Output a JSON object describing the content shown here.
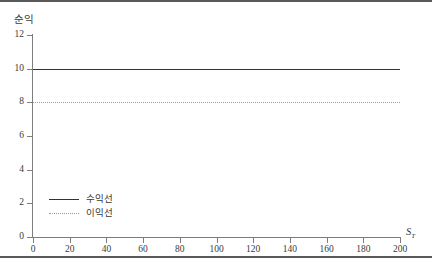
{
  "chart_data": {
    "type": "line",
    "title": "",
    "xlabel": "S_T",
    "xlabel_base": "S",
    "xlabel_sub": "T",
    "ylabel": "순익",
    "xlim": [
      0,
      200
    ],
    "ylim": [
      0,
      12
    ],
    "xticks": [
      0,
      20,
      40,
      60,
      80,
      100,
      120,
      140,
      160,
      180,
      200
    ],
    "yticks": [
      0,
      2,
      4,
      6,
      8,
      10,
      12
    ],
    "grid": false,
    "legend_position": "lower-left-inside",
    "series": [
      {
        "name": "수익선",
        "style": "solid",
        "color": "#333333",
        "constant_value": 10,
        "x": [
          0,
          20,
          40,
          60,
          80,
          100,
          120,
          140,
          160,
          180,
          200
        ],
        "values": [
          10,
          10,
          10,
          10,
          10,
          10,
          10,
          10,
          10,
          10,
          10
        ]
      },
      {
        "name": "이익선",
        "style": "dotted",
        "color": "#9A9A9A",
        "constant_value": 8,
        "x": [
          0,
          20,
          40,
          60,
          80,
          100,
          120,
          140,
          160,
          180,
          200
        ],
        "values": [
          8,
          8,
          8,
          8,
          8,
          8,
          8,
          8,
          8,
          8,
          8
        ]
      }
    ]
  },
  "legend": {
    "items": [
      {
        "label": "수익선"
      },
      {
        "label": "이익선"
      }
    ]
  },
  "ticklabels": {
    "y": [
      "0",
      "2",
      "4",
      "6",
      "8",
      "10",
      "12"
    ],
    "x": [
      "0",
      "20",
      "40",
      "60",
      "80",
      "100",
      "120",
      "140",
      "160",
      "180",
      "200"
    ]
  }
}
